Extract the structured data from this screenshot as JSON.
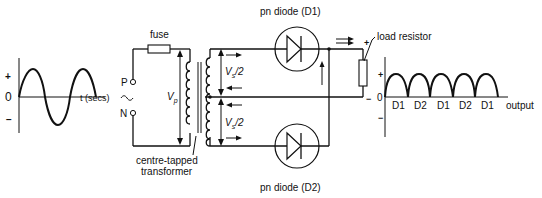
{
  "diagram": {
    "input_graph": {
      "plus_label": "+",
      "zero_label": "0",
      "minus_label": "−",
      "x_axis_label": "t (secs)",
      "waveform": "sine",
      "cycles": 2
    },
    "source": {
      "p_terminal": "P",
      "n_terminal": "N",
      "ac_symbol": "~",
      "fuse_label": "fuse",
      "primary_voltage_label": "V",
      "primary_voltage_sub": "p"
    },
    "transformer": {
      "label_line1": "centre-tapped",
      "label_line2": "transformer",
      "upper_secondary_label": "V",
      "upper_secondary_sub": "s",
      "upper_secondary_suffix": "/2",
      "lower_secondary_label": "V",
      "lower_secondary_sub": "s",
      "lower_secondary_suffix": "/2"
    },
    "diodes": [
      {
        "label": "pn diode (D1)"
      },
      {
        "label": "pn diode (D2)"
      }
    ],
    "load": {
      "label": "load resistor",
      "plus": "+",
      "minus": "−"
    },
    "output_graph": {
      "plus_label": "+",
      "zero_label": "0",
      "minus_label": "−",
      "x_axis_label": "output",
      "half_cycle_labels": [
        "D1",
        "D2",
        "D1",
        "D2",
        "D1"
      ]
    }
  }
}
